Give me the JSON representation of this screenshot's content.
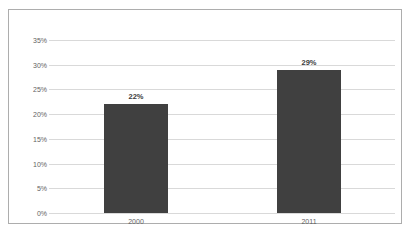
{
  "chart_data": {
    "type": "bar",
    "title": "",
    "subtitle": "",
    "xlabel": "",
    "ylabel": "",
    "categories": [
      "2000",
      "2011"
    ],
    "values": [
      22,
      29
    ],
    "data_labels": [
      "22%",
      "29%"
    ],
    "ylim": [
      0,
      35
    ],
    "ytick_values": [
      0,
      5,
      10,
      15,
      20,
      25,
      30,
      35
    ],
    "ytick_labels": [
      "0%",
      "5%",
      "10%",
      "15%",
      "20%",
      "25%",
      "30%",
      "35%"
    ],
    "grid": "horizontal",
    "legend": "none",
    "colors": {
      "bar_fill": "#404040",
      "gridline": "#d9d9d9",
      "border": "#adadad",
      "background": "#ffffff",
      "tick_label_text": "#636363",
      "data_label_text": "#3a3a3a"
    }
  }
}
